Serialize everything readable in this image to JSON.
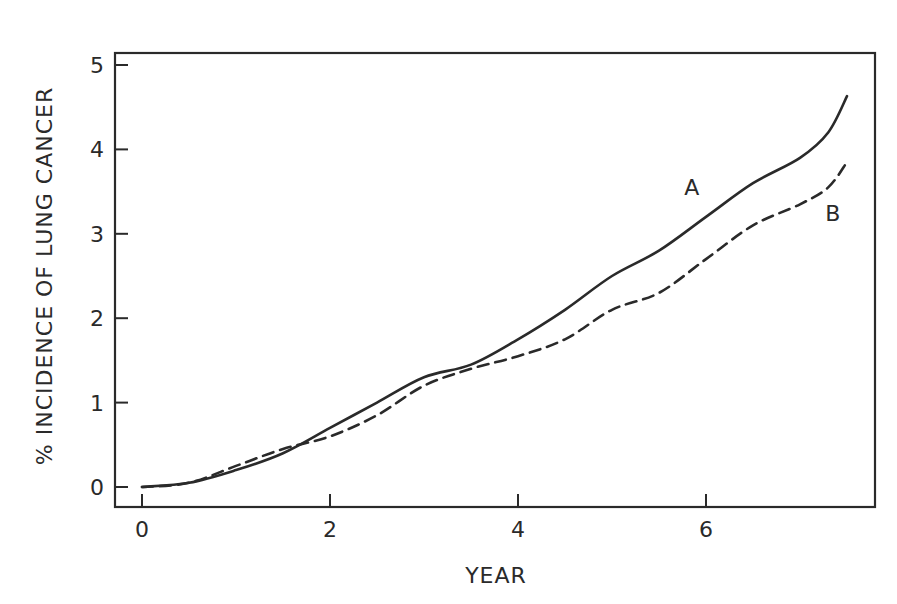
{
  "chart_data": {
    "type": "line",
    "title": "",
    "xlabel": "YEAR",
    "ylabel": "% INCIDENCE OF LUNG CANCER",
    "xlim": [
      0,
      7.6
    ],
    "ylim": [
      0,
      5
    ],
    "x_ticks": [
      "0",
      "2",
      "4",
      "6"
    ],
    "y_ticks": [
      "0",
      "1",
      "2",
      "3",
      "4",
      "5"
    ],
    "grid": false,
    "legend": "inline labels at curve ends",
    "series": [
      {
        "name": "A",
        "style": "solid",
        "x": [
          0,
          0.5,
          1,
          1.5,
          2,
          2.5,
          3,
          3.5,
          4,
          4.5,
          5,
          5.5,
          6,
          6.5,
          7,
          7.3,
          7.5
        ],
        "values": [
          0,
          0.05,
          0.2,
          0.4,
          0.7,
          1.0,
          1.3,
          1.45,
          1.75,
          2.1,
          2.5,
          2.8,
          3.2,
          3.6,
          3.9,
          4.2,
          4.63
        ]
      },
      {
        "name": "B",
        "style": "dashed",
        "x": [
          0,
          0.5,
          1,
          1.5,
          2,
          2.5,
          3,
          3.5,
          4,
          4.5,
          5,
          5.5,
          6,
          6.5,
          7,
          7.3,
          7.5
        ],
        "values": [
          0,
          0.05,
          0.25,
          0.45,
          0.6,
          0.85,
          1.2,
          1.4,
          1.55,
          1.75,
          2.1,
          2.3,
          2.7,
          3.1,
          3.35,
          3.55,
          3.85
        ]
      }
    ],
    "annotations": [
      {
        "text": "A",
        "x": 5.85,
        "y": 3.55
      },
      {
        "text": "B",
        "x": 7.35,
        "y": 3.25
      }
    ],
    "colors": {
      "ink": "#2a2a2a",
      "background": "#ffffff"
    }
  }
}
